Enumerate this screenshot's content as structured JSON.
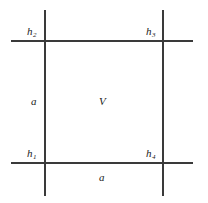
{
  "figure": {
    "background_color": "#ffffff",
    "line_color": "#3a3a3a",
    "text_color": "#1a1a1a"
  },
  "lines": [
    {
      "name": "top-horizontal-line",
      "orientation": "horizontal",
      "x": 11,
      "y": 40,
      "length": 182
    },
    {
      "name": "bottom-horizontal-line",
      "orientation": "horizontal",
      "x": 11,
      "y": 162,
      "length": 182
    },
    {
      "name": "left-vertical-line",
      "orientation": "vertical",
      "x": 44,
      "y": 10,
      "length": 186
    },
    {
      "name": "right-vertical-line",
      "orientation": "vertical",
      "x": 162,
      "y": 10,
      "length": 186
    }
  ],
  "labels": {
    "top_left": {
      "base": "h",
      "sub": "2"
    },
    "top_right": {
      "base": "h",
      "sub": "3"
    },
    "bottom_left": {
      "base": "h",
      "sub": "1"
    },
    "bottom_right": {
      "base": "h",
      "sub": "4"
    },
    "left_side": {
      "base": "a",
      "sub": ""
    },
    "bottom_side": {
      "base": "a",
      "sub": ""
    },
    "center": {
      "base": "V",
      "sub": ""
    }
  }
}
